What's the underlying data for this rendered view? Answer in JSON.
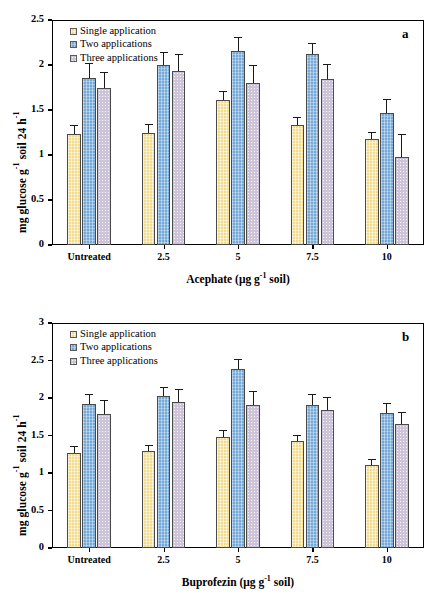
{
  "figure": {
    "background": "#ffffff",
    "series_colors": [
      "#f2dc8c",
      "#74a9d8",
      "#cdc4da"
    ],
    "series_names": [
      "Single application",
      "Two applications",
      "Three applications"
    ]
  },
  "chart_data": [
    {
      "type": "bar",
      "panel_letter": "a",
      "title": "",
      "xlabel": "Acephate (μg g⁻¹ soil)",
      "ylabel": "mg glucose g⁻¹ soil 24 h⁻¹",
      "categories": [
        "Untreated",
        "2.5",
        "5",
        "7.5",
        "10"
      ],
      "ylim": [
        0,
        2.5
      ],
      "yticks": [
        "0",
        "0.5",
        "1",
        "1.5",
        "2",
        "2.5"
      ],
      "ytick_values": [
        0,
        0.5,
        1,
        1.5,
        2,
        2.5
      ],
      "grid": false,
      "legend_position": "top-left",
      "series": [
        {
          "name": "Single application",
          "values": [
            1.23,
            1.24,
            1.61,
            1.33,
            1.18
          ],
          "errors": [
            0.1,
            0.11,
            0.1,
            0.09,
            0.08
          ]
        },
        {
          "name": "Two applications",
          "values": [
            1.86,
            2.0,
            2.16,
            2.12,
            1.47
          ],
          "errors": [
            0.16,
            0.15,
            0.15,
            0.12,
            0.15
          ]
        },
        {
          "name": "Three applications",
          "values": [
            1.74,
            1.93,
            1.8,
            1.84,
            0.98
          ],
          "errors": [
            0.18,
            0.19,
            0.2,
            0.17,
            0.25
          ]
        }
      ]
    },
    {
      "type": "bar",
      "panel_letter": "b",
      "title": "",
      "xlabel": "Buprofezin (μg g⁻¹ soil)",
      "ylabel": "mg glucose g⁻¹ soil 24 h⁻¹",
      "categories": [
        "Untreated",
        "2.5",
        "5",
        "7.5",
        "10"
      ],
      "ylim": [
        0,
        3
      ],
      "yticks": [
        "0",
        "0.5",
        "1",
        "1.5",
        "2",
        "2.5",
        "3"
      ],
      "ytick_values": [
        0,
        0.5,
        1,
        1.5,
        2,
        2.5,
        3
      ],
      "grid": false,
      "legend_position": "top-left",
      "series": [
        {
          "name": "Single application",
          "values": [
            1.27,
            1.3,
            1.48,
            1.43,
            1.11
          ],
          "errors": [
            0.09,
            0.08,
            0.09,
            0.08,
            0.08
          ]
        },
        {
          "name": "Two applications",
          "values": [
            1.92,
            2.03,
            2.39,
            1.91,
            1.8
          ],
          "errors": [
            0.13,
            0.12,
            0.13,
            0.15,
            0.14
          ]
        },
        {
          "name": "Three applications",
          "values": [
            1.79,
            1.95,
            1.91,
            1.84,
            1.65
          ],
          "errors": [
            0.19,
            0.17,
            0.18,
            0.18,
            0.17
          ]
        }
      ]
    }
  ]
}
